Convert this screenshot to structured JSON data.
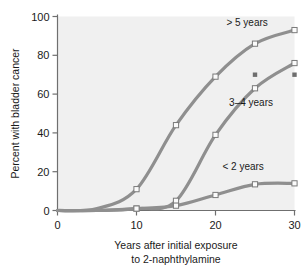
{
  "chart_data": {
    "type": "line",
    "title": "",
    "subtitle": "",
    "xlabel": "Years after initial exposure",
    "xlabel_line2": "to 2-naphthylamine",
    "ylabel": "Percent with bladder cancer",
    "xlim": [
      0,
      30
    ],
    "ylim": [
      0,
      100
    ],
    "xticks": [
      0,
      10,
      20,
      30
    ],
    "xtick_labels": [
      "0",
      "10",
      "20",
      "30"
    ],
    "yticks": [
      0,
      20,
      40,
      60,
      80,
      100
    ],
    "ytick_labels": [
      "0",
      "20",
      "40",
      "60",
      "80",
      "100"
    ],
    "grid": false,
    "legend_position": "inline-annotations",
    "x": [
      0,
      5,
      10,
      15,
      20,
      25,
      30
    ],
    "series": [
      {
        "name": "> 5 years",
        "label": "> 5 years",
        "color": "#8f8f8f",
        "marker": "open-square",
        "values": [
          0,
          1,
          11,
          44,
          69,
          86,
          93
        ],
        "label_x": 24.0,
        "label_y": 97
      },
      {
        "name": "3-4 years",
        "label": "3–4 years",
        "color": "#8f8f8f",
        "marker": "open-square",
        "values": [
          0,
          0,
          1,
          5,
          39,
          63,
          76
        ],
        "label_x": 24.5,
        "label_y": 56
      },
      {
        "name": "< 2 years",
        "label": "< 2 years",
        "color": "#8f8f8f",
        "marker": "open-square",
        "values": [
          0,
          0,
          1,
          2.5,
          8,
          13.5,
          14
        ],
        "label_x": 23.5,
        "label_y": 23
      }
    ],
    "annotations": [
      {
        "name": "extra-marker-1",
        "x": 25,
        "y": 70,
        "marker": "filled-square",
        "color": "#6e6e6e"
      },
      {
        "name": "extra-marker-2",
        "x": 30,
        "y": 70,
        "marker": "filled-square",
        "color": "#6e6e6e"
      }
    ],
    "colors": {
      "plot_background": "#f0f0f0",
      "page_background": "#ffffff",
      "line": "#8f8f8f",
      "marker_fill": "#fbfbfb",
      "marker_stroke": "#7a7a7a",
      "axis": "#6f6f6f",
      "text": "#1a1a1a"
    }
  }
}
